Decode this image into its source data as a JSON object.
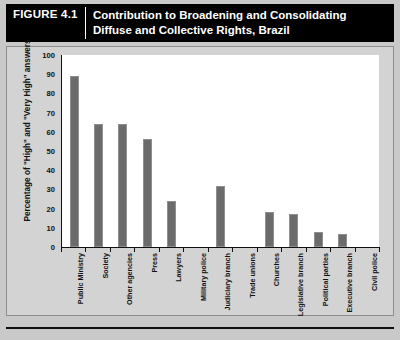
{
  "header": {
    "figure_number": "FIGURE 4.1",
    "title": "Contribution to Broadening and Consolidating Diffuse and Collective Rights, Brazil"
  },
  "colors": {
    "bar": "#6b6b6b",
    "panel_background": "#d3d3d3",
    "plot_background": "#ffffff",
    "header_background": "#000000",
    "header_text": "#ffffff",
    "axis": "#111111"
  },
  "chart_data": {
    "type": "bar",
    "title": "Contribution to Broadening and Consolidating Diffuse and Collective Rights, Brazil",
    "xlabel": "",
    "ylabel": "Percentage of \"High\" and \"Very High\" answers",
    "ylim": [
      0,
      100
    ],
    "ytick_values": [
      0,
      10,
      20,
      30,
      40,
      50,
      60,
      70,
      80,
      90,
      100
    ],
    "ytick_labels": [
      "0",
      "10",
      "20",
      "30",
      "40",
      "50",
      "60",
      "70",
      "80",
      "90",
      "100"
    ],
    "grid": false,
    "legend": false,
    "categories": [
      "Public Ministry",
      "Society",
      "Other agencies",
      "Press",
      "Lawyers",
      "Military police",
      "Judiciary branch",
      "Trade unions",
      "Churches",
      "Legislative branch",
      "Political parties",
      "Executive branch",
      "Civil police"
    ],
    "values": [
      89,
      64,
      64,
      56,
      24,
      0,
      32,
      0,
      18,
      17,
      8,
      7,
      0
    ]
  }
}
